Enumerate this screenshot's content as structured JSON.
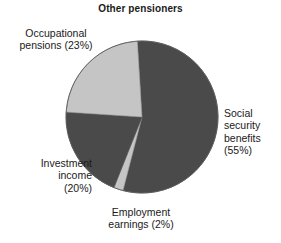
{
  "chart_data": {
    "type": "pie",
    "title": "Other pensioners",
    "xlabel": "",
    "ylabel": "",
    "categories": [
      "Social security benefits",
      "Employment earnings",
      "Investment income",
      "Occupational pensions"
    ],
    "values": [
      55,
      2,
      20,
      23
    ],
    "value_unit": "%",
    "legend_position": "none",
    "grid": false,
    "slice_colors": [
      "#4a4a4a",
      "#c5c5c5",
      "#4a4a4a",
      "#c5c5c5"
    ],
    "slices": [
      {
        "name": "Social security benefits",
        "value": 55,
        "color": "#4a4a4a",
        "label_lines": [
          "Social",
          "security",
          "benefits",
          "(55%)"
        ],
        "label_text": "Social security benefits (55%)"
      },
      {
        "name": "Employment earnings",
        "value": 2,
        "color": "#c5c5c5",
        "label_lines": [
          "Employment",
          "earnings (2%)"
        ],
        "label_text": "Employment earnings (2%)"
      },
      {
        "name": "Investment income",
        "value": 20,
        "color": "#4a4a4a",
        "label_lines": [
          "Investment",
          "income",
          "(20%)"
        ],
        "label_text": "Investment income (20%)"
      },
      {
        "name": "Occupational pensions",
        "value": 23,
        "color": "#c5c5c5",
        "label_lines": [
          "Occupational",
          "pensions (23%)"
        ],
        "label_text": "Occupational pensions (23%)"
      }
    ]
  },
  "chart": {
    "title": "Other pensioners",
    "background_color": "#ffffff",
    "outline_color": "#555555"
  },
  "labels": {
    "occupational": {
      "line1": "Occupational",
      "line2": "pensions (23%)"
    },
    "investment": {
      "line1": "Investment",
      "line2": "income",
      "line3": "(20%)"
    },
    "employment": {
      "line1": "Employment",
      "line2": "earnings (2%)"
    },
    "social": {
      "line1": "Social",
      "line2": "security",
      "line3": "benefits",
      "line4": "(55%)"
    }
  }
}
